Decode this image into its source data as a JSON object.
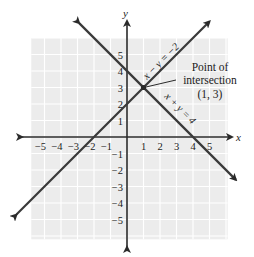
{
  "chart_data": {
    "type": "line",
    "title": "",
    "xlabel": "x",
    "ylabel": "y",
    "xlim": [
      -5.8,
      6.1
    ],
    "ylim": [
      -6.2,
      6.0
    ],
    "grid": true,
    "x_ticks": [
      "-5",
      "-4",
      "-3",
      "-2",
      "-1",
      "1",
      "2",
      "3",
      "4",
      "5"
    ],
    "y_ticks": [
      "5",
      "4",
      "3",
      "2",
      "1",
      "-1",
      "-2",
      "-3",
      "-4",
      "-5"
    ],
    "series": [
      {
        "name": "x − y = −2",
        "equation": "y = x + 2",
        "x": [
          -6.7,
          5.0
        ],
        "y": [
          -4.7,
          7.0
        ]
      },
      {
        "name": "x + y = 4",
        "equation": "y = -x + 4",
        "x": [
          -2.9,
          6.6
        ],
        "y": [
          6.9,
          -2.6
        ]
      }
    ],
    "annotations": [
      {
        "text_lines": [
          "Point of",
          "intersection",
          "(1, 3)"
        ],
        "point": [
          1,
          3
        ]
      }
    ],
    "legend": "none (lines labeled inline)"
  },
  "labels": {
    "x_axis": "x",
    "y_axis": "y",
    "line1": "x − y = −2",
    "line2": "x + y = 4",
    "annotation_line1": "Point of",
    "annotation_line2": "intersection",
    "annotation_line3": "(1, 3)"
  },
  "colors": {
    "grid_fill": "#ececec",
    "grid_lines": "#ffffff",
    "axes": "#2a2a2a",
    "lines": "#3a3a3a",
    "text": "#222222"
  }
}
